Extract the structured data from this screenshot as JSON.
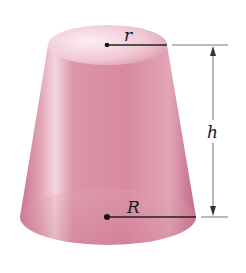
{
  "figure": {
    "labels": {
      "top_radius": "r",
      "bottom_radius": "R",
      "height": "h"
    },
    "colors": {
      "body": "#d98aa0",
      "body_dark": "#b9637d",
      "highlight": "#f6dde4",
      "top_face": "#f3d3dc",
      "line": "#222222",
      "dimension_line": "#555555"
    }
  }
}
